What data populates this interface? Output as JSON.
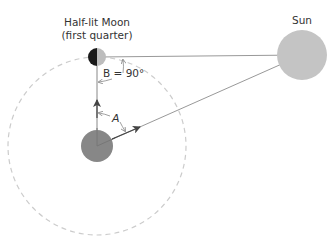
{
  "diagram": {
    "labels": {
      "moon_line1": "Half-lit Moon",
      "moon_line2": "(first quarter)",
      "sun": "Sun",
      "angle_b": "B = 90°",
      "angle_a": "A"
    },
    "bodies": {
      "earth": {
        "cx": 97,
        "cy": 146,
        "r": 16,
        "color": "#878787"
      },
      "moon": {
        "cx": 97,
        "cy": 57,
        "r": 9,
        "dark_color": "#1a1a1a",
        "lit_color": "#bdbdbd"
      },
      "sun": {
        "cx": 302,
        "cy": 55,
        "r": 25,
        "color": "#c4c4c4"
      }
    },
    "orbit": {
      "cx": 97,
      "cy": 146,
      "r": 89,
      "stroke": "#cccccc",
      "style": "dashed"
    },
    "colors": {
      "line": "#999999",
      "arrow": "#444444",
      "text": "#333333"
    }
  }
}
